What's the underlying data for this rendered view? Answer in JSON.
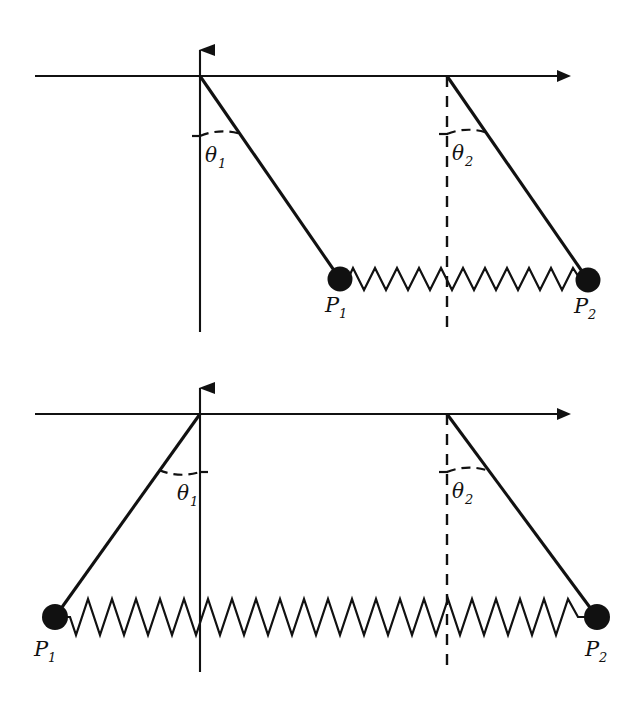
{
  "figure": {
    "title": "",
    "background_color": "#ffffff",
    "stroke_color": "#111111",
    "panels": [
      {
        "id": "top-panel",
        "name": "pendulum-pair-stretched-spring",
        "description": "Two pendulums hanging from a horizontal axis, both displaced to the right; masses joined by a horizontal spring.",
        "axes": {
          "horizontal_axis": {
            "name": "horizontal-axis",
            "arrow": "right",
            "y": 76,
            "x_start": 35,
            "x_end": 572
          },
          "vertical_axis": {
            "name": "vertical-axis",
            "arrow": "up",
            "x": 200,
            "y_top": 36,
            "y_bottom": 332
          },
          "dashed_vertical": {
            "name": "dashed-reference-line",
            "x": 447,
            "y_top": 76,
            "y_bottom": 332
          }
        },
        "pendulums": [
          {
            "pivot_x": 200,
            "pivot_y": 76,
            "bob_x": 340,
            "bob_y": 279,
            "angle_label": "θ",
            "angle_sub": "1",
            "point_label": "P",
            "point_sub": "1"
          },
          {
            "pivot_x": 447,
            "pivot_y": 76,
            "bob_x": 588,
            "bob_y": 280,
            "angle_label": "θ",
            "angle_sub": "2",
            "point_label": "P",
            "point_sub": "2"
          }
        ],
        "spring": {
          "name": "coupling-spring",
          "x_start": 340,
          "x_end": 588,
          "y": 279,
          "coils": 22,
          "amplitude": 11
        }
      },
      {
        "id": "bottom-panel",
        "name": "pendulum-pair-splayed-spring",
        "description": "Two pendulums hanging from a horizontal axis, displaced outward in opposite directions; masses joined by a stretched horizontal spring.",
        "axes": {
          "horizontal_axis": {
            "name": "horizontal-axis",
            "arrow": "right",
            "y": 414,
            "x_start": 35,
            "x_end": 572
          },
          "vertical_axis": {
            "name": "vertical-axis",
            "arrow": "up",
            "x": 200,
            "y_top": 374,
            "y_bottom": 672
          },
          "dashed_vertical": {
            "name": "dashed-reference-line",
            "x": 447,
            "y_top": 414,
            "y_bottom": 672
          }
        },
        "pendulums": [
          {
            "pivot_x": 200,
            "pivot_y": 414,
            "bob_x": 55,
            "bob_y": 617,
            "angle_label": "θ",
            "angle_sub": "1",
            "point_label": "P",
            "point_sub": "1"
          },
          {
            "pivot_x": 447,
            "pivot_y": 414,
            "bob_x": 597,
            "bob_y": 617,
            "angle_label": "θ",
            "angle_sub": "2",
            "point_label": "P",
            "point_sub": "2"
          }
        ],
        "spring": {
          "name": "coupling-spring",
          "x_start": 55,
          "x_end": 597,
          "y": 617,
          "coils": 22,
          "amplitude": 18
        }
      }
    ],
    "labels": {
      "theta1": "θ",
      "theta1_sub": "1",
      "theta2": "θ",
      "theta2_sub": "2",
      "p1": "P",
      "p1_sub": "1",
      "p2": "P",
      "p2_sub": "2"
    }
  }
}
